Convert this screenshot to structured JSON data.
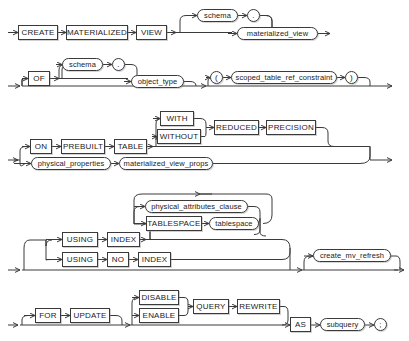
{
  "diagram": {
    "type": "railroad-syntax-diagram",
    "colors": {
      "line": "#3a3a3a",
      "text": "#1b1b1b",
      "background": "#ffffff"
    },
    "rows": [
      {
        "id": "row-create",
        "nodes": [
          {
            "name": "keyword-create",
            "kind": "keyword",
            "label": "CREATE",
            "x": 18,
            "y": 25,
            "w": 40,
            "h": 15
          },
          {
            "name": "keyword-materialized",
            "kind": "keyword",
            "label": "MATERIALIZED",
            "x": 66,
            "y": 25,
            "w": 62,
            "h": 15
          },
          {
            "name": "keyword-view",
            "kind": "keyword",
            "label": "VIEW",
            "x": 136,
            "y": 25,
            "w": 31,
            "h": 15
          },
          {
            "name": "nonterminal-schema-1",
            "kind": "nonterminal",
            "label": "schema",
            "x": 197,
            "y": 9,
            "w": 41,
            "h": 13
          },
          {
            "name": "punct-dot-1",
            "kind": "nonterminal",
            "label": ".",
            "x": 247,
            "y": 9,
            "w": 13,
            "h": 13
          },
          {
            "name": "nonterminal-materialized-view",
            "kind": "nonterminal",
            "label": "materialized_view",
            "x": 237,
            "y": 27,
            "w": 81,
            "h": 13
          }
        ]
      },
      {
        "id": "row-of",
        "nodes": [
          {
            "name": "keyword-of",
            "kind": "keyword",
            "label": "OF",
            "x": 28,
            "y": 71,
            "w": 22,
            "h": 15
          },
          {
            "name": "nonterminal-schema-2",
            "kind": "nonterminal",
            "label": "schema",
            "x": 62,
            "y": 58,
            "w": 41,
            "h": 13
          },
          {
            "name": "punct-dot-2",
            "kind": "nonterminal",
            "label": ".",
            "x": 112,
            "y": 58,
            "w": 13,
            "h": 13
          },
          {
            "name": "nonterminal-object-type",
            "kind": "nonterminal",
            "label": "object_type",
            "x": 131,
            "y": 75,
            "w": 53,
            "h": 13
          },
          {
            "name": "punct-lparen-1",
            "kind": "nonterminal",
            "label": "(",
            "x": 210,
            "y": 71,
            "w": 13,
            "h": 13
          },
          {
            "name": "nonterminal-scoped-table-ref-constraint",
            "kind": "nonterminal",
            "label": "scoped_table_ref_constraint",
            "x": 231,
            "y": 71,
            "w": 106,
            "h": 13
          },
          {
            "name": "punct-rparen-1",
            "kind": "nonterminal",
            "label": ")",
            "x": 345,
            "y": 71,
            "w": 13,
            "h": 13
          }
        ]
      },
      {
        "id": "row-on-prebuilt-table",
        "nodes": [
          {
            "name": "keyword-on",
            "kind": "keyword",
            "label": "ON",
            "x": 30,
            "y": 139,
            "w": 22,
            "h": 15
          },
          {
            "name": "keyword-prebuilt",
            "kind": "keyword",
            "label": "PREBUILT",
            "x": 61,
            "y": 139,
            "w": 44,
            "h": 15
          },
          {
            "name": "keyword-table",
            "kind": "keyword",
            "label": "TABLE",
            "x": 114,
            "y": 139,
            "w": 33,
            "h": 15
          },
          {
            "name": "keyword-with",
            "kind": "keyword",
            "label": "WITH",
            "x": 160,
            "y": 111,
            "w": 34,
            "h": 15
          },
          {
            "name": "keyword-without",
            "kind": "keyword",
            "label": "WITHOUT",
            "x": 157,
            "y": 129,
            "w": 44,
            "h": 15
          },
          {
            "name": "keyword-reduced",
            "kind": "keyword",
            "label": "REDUCED",
            "x": 214,
            "y": 120,
            "w": 45,
            "h": 15
          },
          {
            "name": "keyword-precision",
            "kind": "keyword",
            "label": "PRECISION",
            "x": 266,
            "y": 120,
            "w": 50,
            "h": 15
          },
          {
            "name": "nonterminal-physical-properties",
            "kind": "nonterminal",
            "label": "physical_properties",
            "x": 31,
            "y": 157,
            "w": 80,
            "h": 13
          },
          {
            "name": "nonterminal-materialized-view-props",
            "kind": "nonterminal",
            "label": "materialized_view_props",
            "x": 119,
            "y": 157,
            "w": 94,
            "h": 13
          }
        ]
      },
      {
        "id": "row-using-index",
        "nodes": [
          {
            "name": "keyword-using-1",
            "kind": "keyword",
            "label": "USING",
            "x": 62,
            "y": 232,
            "w": 36,
            "h": 15
          },
          {
            "name": "keyword-index-1",
            "kind": "keyword",
            "label": "INDEX",
            "x": 107,
            "y": 232,
            "w": 33,
            "h": 15
          },
          {
            "name": "keyword-using-2",
            "kind": "keyword",
            "label": "USING",
            "x": 62,
            "y": 252,
            "w": 36,
            "h": 15
          },
          {
            "name": "keyword-no",
            "kind": "keyword",
            "label": "NO",
            "x": 107,
            "y": 252,
            "w": 22,
            "h": 15
          },
          {
            "name": "keyword-index-2",
            "kind": "keyword",
            "label": "INDEX",
            "x": 138,
            "y": 252,
            "w": 33,
            "h": 15
          },
          {
            "name": "nonterminal-physical-attributes-clause",
            "kind": "nonterminal",
            "label": "physical_attributes_clause",
            "x": 145,
            "y": 200,
            "w": 103,
            "h": 13
          },
          {
            "name": "keyword-tablespace",
            "kind": "keyword",
            "label": "TABLESPACE",
            "x": 146,
            "y": 216,
            "w": 56,
            "h": 15
          },
          {
            "name": "nonterminal-tablespace",
            "kind": "nonterminal",
            "label": "tablespace",
            "x": 209,
            "y": 217,
            "w": 50,
            "h": 13
          },
          {
            "name": "nonterminal-create-mv-refresh",
            "kind": "nonterminal",
            "label": "create_mv_refresh",
            "x": 313,
            "y": 249,
            "w": 78,
            "h": 13
          }
        ]
      },
      {
        "id": "row-for-update",
        "nodes": [
          {
            "name": "keyword-for",
            "kind": "keyword",
            "label": "FOR",
            "x": 35,
            "y": 308,
            "w": 26,
            "h": 15
          },
          {
            "name": "keyword-update",
            "kind": "keyword",
            "label": "UPDATE",
            "x": 70,
            "y": 308,
            "w": 40,
            "h": 15
          },
          {
            "name": "keyword-disable",
            "kind": "keyword",
            "label": "DISABLE",
            "x": 139,
            "y": 290,
            "w": 40,
            "h": 15
          },
          {
            "name": "keyword-enable",
            "kind": "keyword",
            "label": "ENABLE",
            "x": 139,
            "y": 308,
            "w": 40,
            "h": 15
          },
          {
            "name": "keyword-query",
            "kind": "keyword",
            "label": "QUERY",
            "x": 193,
            "y": 299,
            "w": 36,
            "h": 15
          },
          {
            "name": "keyword-rewrite",
            "kind": "keyword",
            "label": "REWRITE",
            "x": 237,
            "y": 299,
            "w": 43,
            "h": 15
          },
          {
            "name": "keyword-as",
            "kind": "keyword",
            "label": "AS",
            "x": 290,
            "y": 317,
            "w": 21,
            "h": 15
          },
          {
            "name": "nonterminal-subquery",
            "kind": "nonterminal",
            "label": "subquery",
            "x": 320,
            "y": 318,
            "w": 45,
            "h": 13
          },
          {
            "name": "punct-semicolon",
            "kind": "nonterminal",
            "label": ";",
            "x": 374,
            "y": 318,
            "w": 13,
            "h": 13
          }
        ]
      }
    ]
  }
}
